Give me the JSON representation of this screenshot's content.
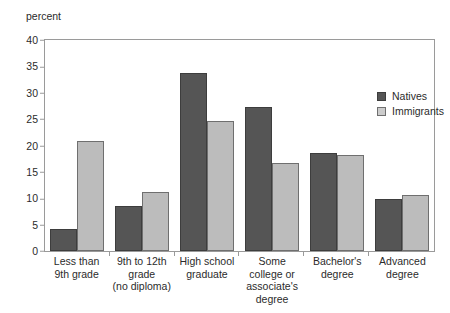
{
  "chart_data": {
    "type": "bar",
    "title": "",
    "subtitle": "",
    "xlabel": "",
    "ylabel": "percent",
    "ylim": [
      0,
      40
    ],
    "yticks": [
      0,
      5,
      10,
      15,
      20,
      25,
      30,
      35,
      40
    ],
    "grid": false,
    "legend_position": "top-right",
    "categories": [
      "Less than\n9th grade",
      "9th to 12th\ngrade\n(no diploma)",
      "High school\ngraduate",
      "Some\ncollege or\nassociate's\ndegree",
      "Bachelor's\ndegree",
      "Advanced\ndegree"
    ],
    "series": [
      {
        "name": "Natives",
        "color": "#555555",
        "values": [
          4.2,
          8.6,
          33.8,
          27.3,
          18.6,
          9.9
        ]
      },
      {
        "name": "Immigrants",
        "color": "#bcbcbc",
        "values": [
          20.9,
          11.2,
          24.6,
          16.6,
          18.2,
          10.6
        ]
      }
    ]
  },
  "legend": {
    "items": [
      {
        "label": "Natives"
      },
      {
        "label": "Immigrants"
      }
    ]
  },
  "axis": {
    "y_unit_label": "percent",
    "tick_labels": [
      "40",
      "35",
      "30",
      "25",
      "20",
      "15",
      "10",
      "5",
      "0"
    ]
  },
  "categories_display": [
    {
      "line1": "Less than",
      "line2": "9th grade",
      "line3": "",
      "line4": ""
    },
    {
      "line1": "9th to 12th",
      "line2": "grade",
      "line3": "(no diploma)",
      "line4": ""
    },
    {
      "line1": "High school",
      "line2": "graduate",
      "line3": "",
      "line4": ""
    },
    {
      "line1": "Some",
      "line2": "college or",
      "line3": "associate's",
      "line4": "degree"
    },
    {
      "line1": "Bachelor's",
      "line2": "degree",
      "line3": "",
      "line4": ""
    },
    {
      "line1": "Advanced",
      "line2": "degree",
      "line3": "",
      "line4": ""
    }
  ]
}
